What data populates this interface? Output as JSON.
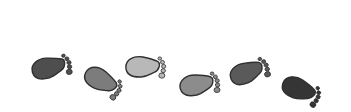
{
  "image": {
    "description": "Six footprints walking left to right in varying shades of gray",
    "background": "#ffffff",
    "outline_color": "#3a3a3a"
  },
  "footprints": [
    {
      "name": "footprint-1",
      "fill": "#4e4e4e",
      "x": 48,
      "y": 68,
      "rotate": -8,
      "toes": "right"
    },
    {
      "name": "footprint-2",
      "fill": "#7c7c7c",
      "x": 100,
      "y": 80,
      "rotate": 35,
      "toes": "right"
    },
    {
      "name": "footprint-3",
      "fill": "#b8b8b8",
      "x": 142,
      "y": 67,
      "rotate": 5,
      "toes": "right"
    },
    {
      "name": "footprint-4",
      "fill": "#8c8c8c",
      "x": 196,
      "y": 85,
      "rotate": -5,
      "toes": "right"
    },
    {
      "name": "footprint-5",
      "fill": "#5a5a5a",
      "x": 246,
      "y": 73,
      "rotate": -15,
      "toes": "right"
    },
    {
      "name": "footprint-6",
      "fill": "#353535",
      "x": 298,
      "y": 89,
      "rotate": 28,
      "toes": "right"
    }
  ]
}
